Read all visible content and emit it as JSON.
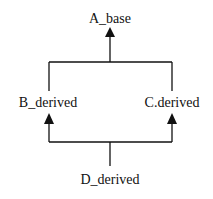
{
  "diagram": {
    "type": "class-inheritance",
    "nodes": {
      "a": {
        "label": "A_base"
      },
      "b": {
        "label": "B_derived"
      },
      "c": {
        "label": "C.derived"
      },
      "d": {
        "label": "D_derived"
      }
    },
    "edges": [
      {
        "from": "B_derived",
        "to": "A_base"
      },
      {
        "from": "C.derived",
        "to": "A_base"
      },
      {
        "from": "D_derived",
        "to": "B_derived"
      },
      {
        "from": "D_derived",
        "to": "C.derived"
      }
    ],
    "line_color": "#111111"
  }
}
